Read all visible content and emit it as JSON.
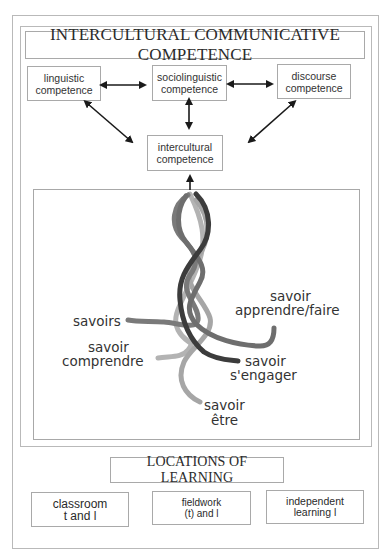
{
  "diagram": {
    "title": "INTERCULTURAL COMMUNICATIVE COMPETENCE",
    "competences": [
      {
        "line1": "linguistic",
        "line2": "competence"
      },
      {
        "line1": "sociolinguistic",
        "line2": "competence"
      },
      {
        "line1": "discourse",
        "line2": "competence"
      }
    ],
    "intercultural": {
      "line1": "intercultural",
      "line2": "competence"
    },
    "braid_labels": {
      "savoirs": "savoirs",
      "apprendre_1": "savoir",
      "apprendre_2": "apprendre/faire",
      "comprendre_1": "savoir",
      "comprendre_2": "comprendre",
      "engager_1": "savoir",
      "engager_2": "s'engager",
      "etre_1": "savoir",
      "etre_2": "être"
    },
    "strand_colors": {
      "savoirs": "#7a7a7a",
      "apprendre": "#6e6e6e",
      "engager": "#3c3c3c",
      "comprendre": "#b3b3b3",
      "etre": "#a6a6a6"
    },
    "locations_title": "LOCATIONS OF LEARNING",
    "locations": [
      {
        "line1": "classroom",
        "line2": "t and l"
      },
      {
        "line1": "fieldwork",
        "line2": "(t) and l"
      },
      {
        "line1": "independent",
        "line2": "learning l"
      }
    ]
  }
}
